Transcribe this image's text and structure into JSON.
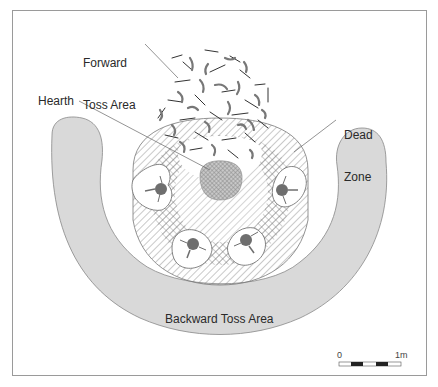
{
  "labels": {
    "forward_toss_line1": "Forward",
    "forward_toss_line2": "Toss Area",
    "hearth": "Hearth",
    "dead_zone_line1": "Dead",
    "dead_zone_line2": "Zone",
    "backward_toss": "Backward Toss Area"
  },
  "scale_bar": {
    "start_label": "0",
    "end_label": "1m"
  },
  "colors": {
    "backward_toss_fill": "#d9d9d9",
    "hearth_fill": "#9a9a9a",
    "person_fill": "#6e6e6e",
    "line": "#555555",
    "frame": "#9a9a9a"
  }
}
